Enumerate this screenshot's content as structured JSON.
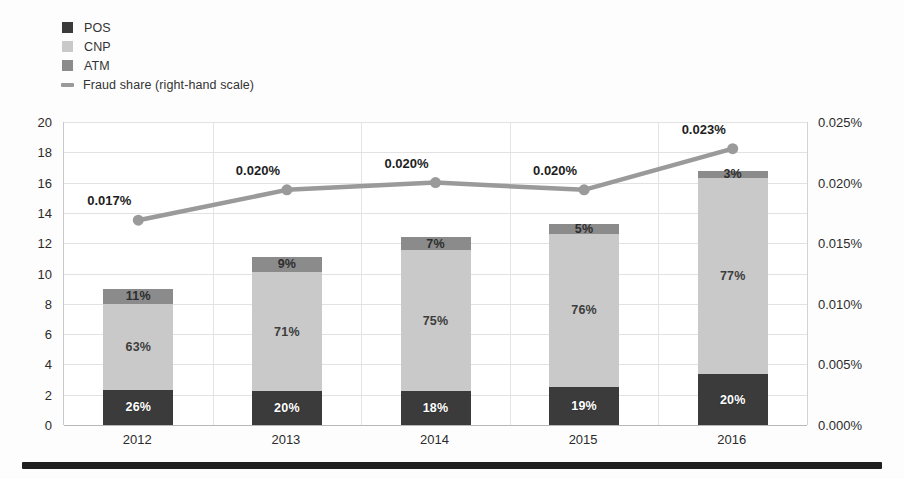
{
  "legend": {
    "items": [
      {
        "label": "POS",
        "marker": "square",
        "color": "#3b3b3b"
      },
      {
        "label": "CNP",
        "marker": "square",
        "color": "#c9c9c9"
      },
      {
        "label": "ATM",
        "marker": "square",
        "color": "#8b8b8b"
      },
      {
        "label": "Fraud share (right-hand scale)",
        "marker": "line",
        "color": "#9a9a9a"
      }
    ]
  },
  "chart_data": {
    "type": "bar",
    "subtype": "stacked-bar-with-line",
    "title": "",
    "xlabel": "",
    "ylabel": "",
    "categories": [
      "2012",
      "2013",
      "2014",
      "2015",
      "2016"
    ],
    "series": [
      {
        "name": "POS",
        "axis": "left",
        "color": "#3b3b3b",
        "values": [
          2.34,
          2.22,
          2.23,
          2.53,
          3.36
        ],
        "labels": [
          "26%",
          "20%",
          "18%",
          "19%",
          "20%"
        ]
      },
      {
        "name": "CNP",
        "axis": "left",
        "color": "#c9c9c9",
        "values": [
          5.67,
          7.88,
          9.3,
          10.11,
          12.94
        ],
        "labels": [
          "63%",
          "71%",
          "75%",
          "76%",
          "77%"
        ]
      },
      {
        "name": "ATM",
        "axis": "left",
        "color": "#8b8b8b",
        "values": [
          0.99,
          1.0,
          0.87,
          0.66,
          0.5
        ],
        "labels": [
          "11%",
          "9%",
          "7%",
          "5%",
          "3%"
        ]
      },
      {
        "name": "Fraud share (right-hand scale)",
        "axis": "right",
        "color": "#9a9a9a",
        "values": [
          0.0169,
          0.0194,
          0.02,
          0.0194,
          0.0228
        ],
        "labels": [
          "0.017%",
          "0.020%",
          "0.020%",
          "0.020%",
          "0.023%"
        ]
      }
    ],
    "totals": [
      9.0,
      11.1,
      12.4,
      13.3,
      16.8
    ],
    "left_axis": {
      "min": 0,
      "max": 20,
      "step": 2,
      "ticks": [
        "0",
        "2",
        "4",
        "6",
        "8",
        "10",
        "12",
        "14",
        "16",
        "18",
        "20"
      ]
    },
    "right_axis": {
      "min": 0,
      "max": 0.025,
      "step": 0.005,
      "ticks": [
        "0.000%",
        "0.005%",
        "0.010%",
        "0.015%",
        "0.020%",
        "0.025%"
      ]
    },
    "grid": true,
    "legend_position": "top-left"
  }
}
